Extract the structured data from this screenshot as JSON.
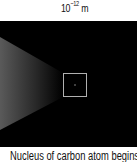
{
  "scale": {
    "base": "10",
    "exponent": "−12",
    "unit": " m"
  },
  "panel": {
    "background": "#000000",
    "beam_color": "#5a5a5a",
    "box_color": "#b0b0b0"
  },
  "caption": {
    "text": "Nucleus of carbon atom begins to a"
  }
}
